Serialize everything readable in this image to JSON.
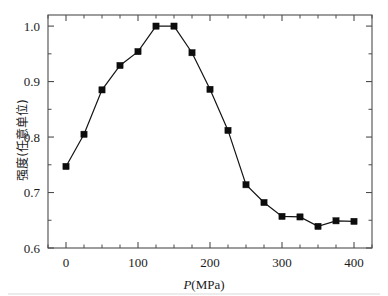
{
  "chart_data": {
    "type": "line",
    "title": "",
    "subtitle": "",
    "xlabel": "P(MPa)",
    "xlabel_italic_part": "P",
    "xlabel_roman_part": "(MPa)",
    "ylabel": "强度(任意单位)",
    "xlim": [
      -25,
      425
    ],
    "ylim": [
      0.6,
      1.02
    ],
    "x_ticks": [
      0,
      100,
      200,
      300,
      400
    ],
    "x_tick_labels": [
      "0",
      "100",
      "200",
      "300",
      "400"
    ],
    "x_minor_ticks": [
      -25,
      25,
      50,
      75,
      125,
      150,
      175,
      225,
      250,
      275,
      325,
      350,
      375,
      425
    ],
    "y_ticks": [
      0.6,
      0.7,
      0.8,
      0.9,
      1.0
    ],
    "y_tick_labels": [
      "0.6",
      "0.7",
      "0.8",
      "0.9",
      "1.0"
    ],
    "y_minor_ticks": [
      0.65,
      0.75,
      0.85,
      0.95
    ],
    "grid": false,
    "legend": false,
    "legend_position": "none",
    "marker": "square",
    "line_color": "#141414",
    "marker_color": "#0d0d0d",
    "x": [
      0,
      25,
      50,
      75,
      100,
      125,
      150,
      175,
      200,
      225,
      250,
      275,
      300,
      325,
      350,
      375,
      400
    ],
    "values": [
      0.747,
      0.805,
      0.885,
      0.929,
      0.954,
      1.0,
      1.0,
      0.952,
      0.886,
      0.812,
      0.714,
      0.682,
      0.657,
      0.656,
      0.639,
      0.649,
      0.648
    ],
    "series": [
      {
        "name": "intensity",
        "x": [
          0,
          25,
          50,
          75,
          100,
          125,
          150,
          175,
          200,
          225,
          250,
          275,
          300,
          325,
          350,
          375,
          400
        ],
        "values": [
          0.747,
          0.805,
          0.885,
          0.929,
          0.954,
          1.0,
          1.0,
          0.952,
          0.886,
          0.812,
          0.714,
          0.682,
          0.657,
          0.656,
          0.639,
          0.649,
          0.648
        ]
      }
    ],
    "annotations": []
  }
}
